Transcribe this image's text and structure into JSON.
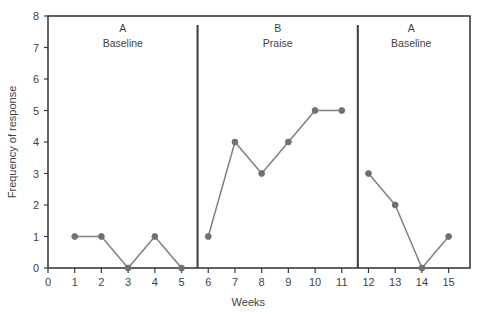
{
  "chart_data": {
    "type": "line",
    "title": "",
    "xlabel": "Weeks",
    "ylabel": "Frequency of response",
    "xlim": [
      0,
      15.8
    ],
    "ylim": [
      0,
      8
    ],
    "grid": false,
    "legend": "none",
    "x_ticks": [
      "0",
      "1",
      "2",
      "3",
      "4",
      "5",
      "6",
      "7",
      "8",
      "9",
      "10",
      "11",
      "12",
      "13",
      "14",
      "15"
    ],
    "y_ticks": [
      "0",
      "1",
      "2",
      "3",
      "4",
      "5",
      "6",
      "7",
      "8"
    ],
    "x": [
      1,
      2,
      3,
      4,
      5,
      6,
      7,
      8,
      9,
      10,
      11,
      12,
      13,
      14,
      15
    ],
    "values": [
      1,
      1,
      0,
      1,
      0,
      1,
      4,
      3,
      4,
      5,
      5,
      3,
      2,
      0,
      1
    ],
    "series": [
      {
        "name": "Frequency of response",
        "x": [
          1,
          2,
          3,
          4,
          5,
          6,
          7,
          8,
          9,
          10,
          11,
          12,
          13,
          14,
          15
        ],
        "values": [
          1,
          1,
          0,
          1,
          0,
          1,
          4,
          3,
          4,
          5,
          5,
          3,
          2,
          0,
          1
        ]
      }
    ],
    "segments": [
      {
        "phase": "A",
        "x": [
          1,
          2,
          3,
          4,
          5
        ],
        "values": [
          1,
          1,
          0,
          1,
          0
        ]
      },
      {
        "phase": "B",
        "x": [
          6,
          7,
          8,
          9,
          10,
          11
        ],
        "values": [
          1,
          4,
          3,
          4,
          5,
          5
        ]
      },
      {
        "phase": "A2",
        "x": [
          12,
          13,
          14,
          15
        ],
        "values": [
          3,
          2,
          0,
          1
        ]
      }
    ],
    "phases": [
      {
        "letter": "A",
        "name": "Baseline",
        "x_start": 0,
        "x_end": 5.6,
        "label_x": 2.8
      },
      {
        "letter": "B",
        "name": "Praise",
        "x_start": 5.6,
        "x_end": 11.6,
        "label_x": 8.6
      },
      {
        "letter": "A",
        "name": "Baseline",
        "x_start": 11.6,
        "x_end": 15.8,
        "label_x": 13.6
      }
    ],
    "phase_dividers": [
      5.6,
      11.6
    ],
    "colors": {
      "line": "#808080",
      "marker": "#707070",
      "axis": "#3b3b3b",
      "divider": "#3b3b3b",
      "text": "#3f3f3f",
      "background": "#ffffff"
    }
  }
}
